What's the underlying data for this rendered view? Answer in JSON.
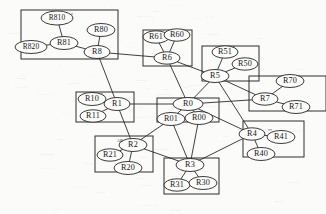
{
  "diagram": {
    "kind": "node-link-graph",
    "canvas": {
      "width": 326,
      "height": 214
    },
    "colors": {
      "background": "#fbfbfa",
      "stroke": "#2a2a2a",
      "node_fill": "#fdfdfc",
      "node_stroke": "#252525",
      "text": "#141414"
    }
  },
  "chart_data": {
    "type": "diagram",
    "areas": [
      {
        "id": "area-8",
        "label": "",
        "x": 21,
        "y": 10,
        "w": 97,
        "h": 49
      },
      {
        "id": "area-6",
        "label": "",
        "x": 143,
        "y": 30,
        "w": 49,
        "h": 36
      },
      {
        "id": "area-5",
        "label": "",
        "x": 202,
        "y": 46,
        "w": 57,
        "h": 35
      },
      {
        "id": "area-7",
        "label": "",
        "x": 249,
        "y": 76,
        "w": 77,
        "h": 35
      },
      {
        "id": "area-1",
        "label": "",
        "x": 76,
        "y": 92,
        "w": 58,
        "h": 30
      },
      {
        "id": "area-0",
        "label": "",
        "x": 157,
        "y": 98,
        "w": 62,
        "h": 24
      },
      {
        "id": "area-4",
        "label": "",
        "x": 243,
        "y": 121,
        "w": 61,
        "h": 36
      },
      {
        "id": "area-2",
        "label": "",
        "x": 95,
        "y": 136,
        "w": 58,
        "h": 36
      },
      {
        "id": "area-3",
        "label": "",
        "x": 164,
        "y": 158,
        "w": 55,
        "h": 36
      }
    ],
    "nodes": [
      {
        "id": "R810",
        "label": "R810",
        "x": 57,
        "y": 18,
        "rx": 16,
        "ry": 7
      },
      {
        "id": "R80",
        "label": "R80",
        "x": 101,
        "y": 30,
        "rx": 14,
        "ry": 6.5
      },
      {
        "id": "R81",
        "label": "R81",
        "x": 64,
        "y": 43,
        "rx": 14,
        "ry": 6.5
      },
      {
        "id": "R820",
        "label": "R820",
        "x": 31,
        "y": 47,
        "rx": 16,
        "ry": 6.5
      },
      {
        "id": "R8",
        "label": "R8",
        "x": 97,
        "y": 52,
        "rx": 13,
        "ry": 6.5
      },
      {
        "id": "R61",
        "label": "R61",
        "x": 156,
        "y": 37,
        "rx": 13,
        "ry": 6.2
      },
      {
        "id": "R60",
        "label": "R60",
        "x": 177,
        "y": 35,
        "rx": 13,
        "ry": 6.2
      },
      {
        "id": "R6",
        "label": "R6",
        "x": 167,
        "y": 58,
        "rx": 13,
        "ry": 6.2
      },
      {
        "id": "R51",
        "label": "R51",
        "x": 225,
        "y": 52,
        "rx": 13,
        "ry": 6.2
      },
      {
        "id": "R50",
        "label": "R50",
        "x": 245,
        "y": 64,
        "rx": 13,
        "ry": 6.2
      },
      {
        "id": "R5",
        "label": "R5",
        "x": 215,
        "y": 76,
        "rx": 14,
        "ry": 6.5
      },
      {
        "id": "R70",
        "label": "R70",
        "x": 290,
        "y": 81,
        "rx": 14,
        "ry": 6.5
      },
      {
        "id": "R7",
        "label": "R7",
        "x": 265,
        "y": 99,
        "rx": 13,
        "ry": 6.2
      },
      {
        "id": "R71",
        "label": "R71",
        "x": 296,
        "y": 107,
        "rx": 14,
        "ry": 6.5
      },
      {
        "id": "R10",
        "label": "R10",
        "x": 92,
        "y": 99,
        "rx": 14,
        "ry": 6.5
      },
      {
        "id": "R1",
        "label": "R1",
        "x": 117,
        "y": 104,
        "rx": 13,
        "ry": 6.5
      },
      {
        "id": "R11",
        "label": "R11",
        "x": 93,
        "y": 116,
        "rx": 13,
        "ry": 6.2
      },
      {
        "id": "R0",
        "label": "R0",
        "x": 188,
        "y": 104,
        "rx": 15,
        "ry": 6.5
      },
      {
        "id": "R01",
        "label": "R01",
        "x": 171,
        "y": 119,
        "rx": 14,
        "ry": 6.5
      },
      {
        "id": "R00",
        "label": "R00",
        "x": 199,
        "y": 118,
        "rx": 14,
        "ry": 6.5
      },
      {
        "id": "R4",
        "label": "R4",
        "x": 252,
        "y": 134,
        "rx": 13,
        "ry": 6.2
      },
      {
        "id": "R41",
        "label": "R41",
        "x": 281,
        "y": 137,
        "rx": 14,
        "ry": 6.5
      },
      {
        "id": "R40",
        "label": "R40",
        "x": 261,
        "y": 154,
        "rx": 14,
        "ry": 6.5
      },
      {
        "id": "R2",
        "label": "R2",
        "x": 133,
        "y": 145,
        "rx": 14,
        "ry": 6.5
      },
      {
        "id": "R21",
        "label": "R21",
        "x": 110,
        "y": 155,
        "rx": 13,
        "ry": 6.2
      },
      {
        "id": "R20",
        "label": "R20",
        "x": 128,
        "y": 168,
        "rx": 14,
        "ry": 6.5
      },
      {
        "id": "R3",
        "label": "R3",
        "x": 190,
        "y": 165,
        "rx": 14,
        "ry": 6.5
      },
      {
        "id": "R31",
        "label": "R31",
        "x": 177,
        "y": 185,
        "rx": 13,
        "ry": 6.2
      },
      {
        "id": "R30",
        "label": "R30",
        "x": 203,
        "y": 183,
        "rx": 14,
        "ry": 6.5
      }
    ],
    "edges": [
      {
        "from": "R810",
        "to": "R81"
      },
      {
        "from": "R820",
        "to": "R81"
      },
      {
        "from": "R81",
        "to": "R8"
      },
      {
        "from": "R80",
        "to": "R8"
      },
      {
        "from": "R8",
        "to": "R6"
      },
      {
        "from": "R8",
        "to": "R1"
      },
      {
        "from": "R61",
        "to": "R6"
      },
      {
        "from": "R60",
        "to": "R6"
      },
      {
        "from": "R60",
        "to": "R61"
      },
      {
        "from": "R6",
        "to": "R5"
      },
      {
        "from": "R6",
        "to": "R0"
      },
      {
        "from": "R51",
        "to": "R5"
      },
      {
        "from": "R50",
        "to": "R5"
      },
      {
        "from": "R5",
        "to": "R0"
      },
      {
        "from": "R5",
        "to": "R7"
      },
      {
        "from": "R5",
        "to": "R4"
      },
      {
        "from": "R70",
        "to": "R7"
      },
      {
        "from": "R71",
        "to": "R7"
      },
      {
        "from": "R7",
        "to": "R0"
      },
      {
        "from": "R10",
        "to": "R1"
      },
      {
        "from": "R11",
        "to": "R1"
      },
      {
        "from": "R1",
        "to": "R0"
      },
      {
        "from": "R1",
        "to": "R2"
      },
      {
        "from": "R0",
        "to": "R01"
      },
      {
        "from": "R0",
        "to": "R00"
      },
      {
        "from": "R01",
        "to": "R2"
      },
      {
        "from": "R01",
        "to": "R3"
      },
      {
        "from": "R00",
        "to": "R3"
      },
      {
        "from": "R4",
        "to": "R41"
      },
      {
        "from": "R4",
        "to": "R40"
      },
      {
        "from": "R4",
        "to": "R3"
      },
      {
        "from": "R4",
        "to": "R0"
      },
      {
        "from": "R2",
        "to": "R21"
      },
      {
        "from": "R2",
        "to": "R20"
      },
      {
        "from": "R2",
        "to": "R3"
      },
      {
        "from": "R3",
        "to": "R31"
      },
      {
        "from": "R3",
        "to": "R30"
      }
    ],
    "marks": [
      {
        "id": "mark-r810",
        "text": "*",
        "x": 72,
        "y": 16
      },
      {
        "id": "mark-r51",
        "text": "*",
        "x": 234,
        "y": 49
      },
      {
        "id": "mark-r10",
        "text": "*",
        "x": 102,
        "y": 96
      },
      {
        "id": "mark-r2",
        "text": "AR",
        "x": 120,
        "y": 142
      },
      {
        "id": "mark-r41",
        "text": "**",
        "x": 270,
        "y": 132
      },
      {
        "id": "mark-r3",
        "text": "*",
        "x": 199,
        "y": 162
      }
    ]
  }
}
